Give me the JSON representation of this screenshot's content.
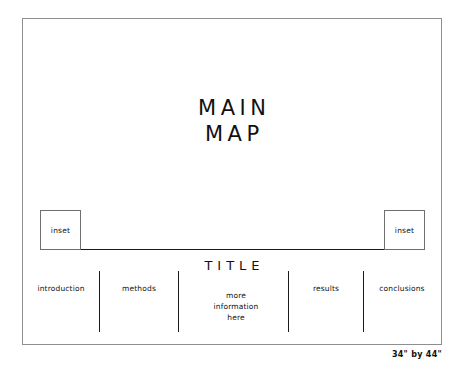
{
  "poster": {
    "map": {
      "line1": "MAIN",
      "line2": "MAP"
    },
    "insets": [
      {
        "id": "inset-left",
        "label": "inset"
      },
      {
        "id": "inset-right",
        "label": "inset"
      }
    ],
    "title": "TITLE",
    "columns": [
      {
        "id": "introduction",
        "lines": [
          "introduction"
        ]
      },
      {
        "id": "methods",
        "lines": [
          "methods"
        ]
      },
      {
        "id": "more-info",
        "lines": [
          "more",
          "information",
          "here"
        ]
      },
      {
        "id": "results",
        "lines": [
          "results"
        ]
      },
      {
        "id": "conclusions",
        "lines": [
          "conclusions"
        ]
      }
    ],
    "dimension_caption": "34\" by 44\"",
    "colors": {
      "background": "#ffffff",
      "ink": "#111111",
      "frame": "#8e8e8e",
      "rule": "#1b1b1b"
    }
  }
}
